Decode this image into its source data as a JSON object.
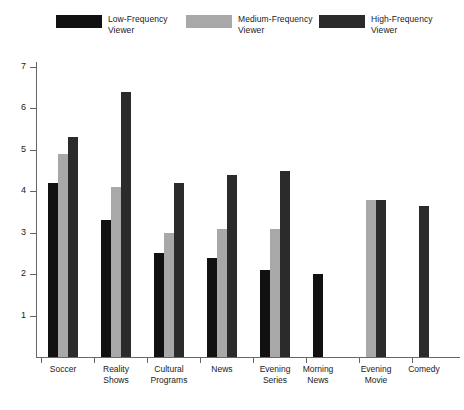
{
  "chart_data": {
    "type": "bar",
    "title": "",
    "subtitle": "",
    "xlabel": "",
    "ylabel": "",
    "ylim": [
      0,
      7
    ],
    "yticks": [
      0,
      1,
      2,
      3,
      4,
      5,
      6,
      7
    ],
    "ytick_labels": [
      "",
      "1",
      "2",
      "3",
      "4",
      "5",
      "6",
      "7"
    ],
    "grid": false,
    "legend_position": "top",
    "categories": [
      "Soccer",
      "Reality\nShows",
      "Cultural\nPrograms",
      "News",
      "Evening\nSeries",
      "Morning\nNews",
      "Evening\nMovie",
      "Comedy"
    ],
    "series": [
      {
        "name": "Low-Frequency\nViewer",
        "color": "#111111",
        "values": [
          4.2,
          3.3,
          2.5,
          2.4,
          2.1,
          2.0,
          null,
          null
        ]
      },
      {
        "name": "Medium-Frequency\nViewer",
        "color": "#a8a8a8",
        "values": [
          4.9,
          4.1,
          3.0,
          3.1,
          3.1,
          null,
          3.8,
          null
        ]
      },
      {
        "name": "High-Frequency\nViewer",
        "color": "#2b2b2b",
        "values": [
          5.3,
          6.4,
          4.2,
          4.4,
          4.5,
          null,
          3.8,
          3.65
        ]
      }
    ]
  },
  "legend": {
    "items": [
      {
        "label": "Low-Frequency\nViewer",
        "color": "#111111"
      },
      {
        "label": "Medium-Frequency\nViewer",
        "color": "#a8a8a8"
      },
      {
        "label": "High-Frequency\nViewer",
        "color": "#2b2b2b"
      }
    ]
  },
  "axis": {
    "y_labels": [
      "7",
      "6",
      "5",
      "4",
      "3",
      "2",
      "1"
    ],
    "axis_color": "#666666"
  }
}
